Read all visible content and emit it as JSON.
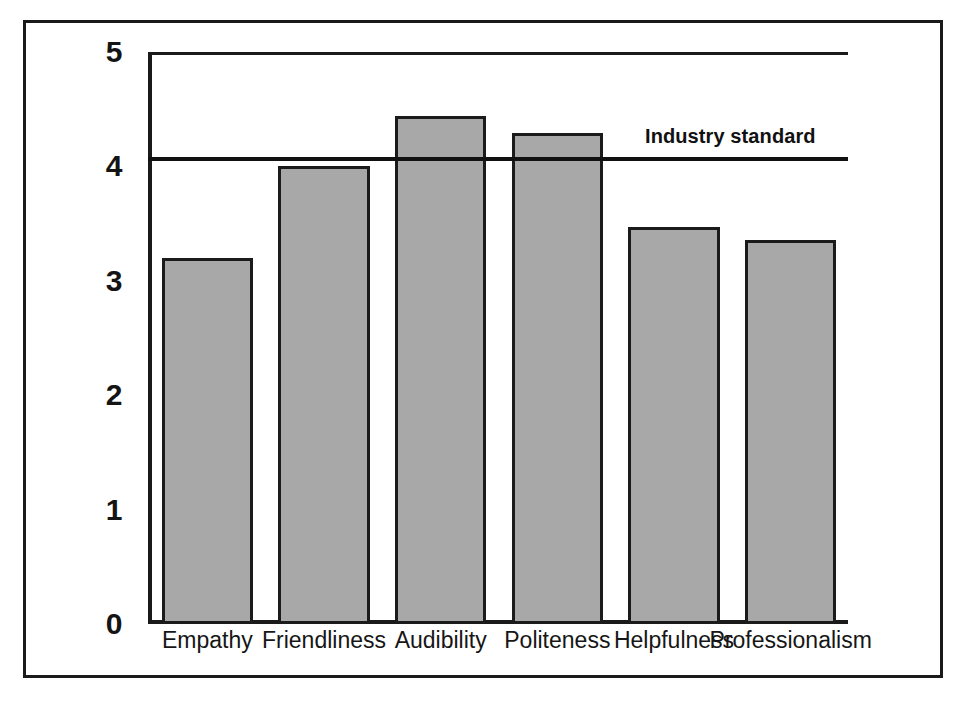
{
  "chart_data": {
    "type": "bar",
    "title": "",
    "xlabel": "",
    "ylabel": "",
    "ylim": [
      0,
      5
    ],
    "grid": false,
    "legend": "none",
    "categories": [
      "Empathy",
      "Friendliness",
      "Audibility",
      "Politeness",
      "Helpfulness",
      "Professionalism"
    ],
    "values": [
      3.2,
      4.0,
      4.44,
      4.29,
      3.47,
      3.36
    ],
    "series": [
      {
        "name": "Rating",
        "values": [
          3.2,
          4.0,
          4.44,
          4.29,
          3.47,
          3.36
        ]
      }
    ],
    "y_ticks": [
      "0",
      "1",
      "2",
      "3",
      "4",
      "5"
    ],
    "y_tick_values": [
      0,
      1,
      2,
      3,
      4,
      5
    ],
    "annotations": [
      {
        "name": "industry-standard",
        "label": "Industry standard",
        "type": "hline",
        "value": 4.08
      }
    ],
    "colors": {
      "bar_fill": "#a8a8a8",
      "bar_stroke": "#1b1b1b",
      "axis": "#1a1a1a",
      "reference_line": "#111111",
      "text": "#141414",
      "background": "#ffffff"
    }
  }
}
